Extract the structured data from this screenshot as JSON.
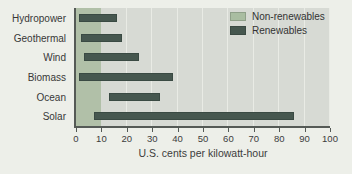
{
  "chart_data": {
    "type": "bar",
    "orientation": "horizontal-range",
    "xlabel": "U.S. cents per kilowatt-hour",
    "xlim": [
      0,
      100
    ],
    "xticks": [
      0,
      10,
      20,
      30,
      40,
      50,
      60,
      70,
      80,
      90,
      100
    ],
    "grid": true,
    "categories": [
      "Hydropower",
      "Geothermal",
      "Wind",
      "Biomass",
      "Ocean",
      "Solar"
    ],
    "series": [
      {
        "name": "Renewables",
        "color": "#46574f",
        "ranges": [
          [
            1,
            16
          ],
          [
            2,
            18
          ],
          [
            3,
            25
          ],
          [
            1,
            38
          ],
          [
            13,
            33
          ],
          [
            7,
            86
          ]
        ]
      }
    ],
    "reference_band": {
      "name": "Non-renewables",
      "color": "#b1c0a8",
      "range": [
        0,
        10
      ]
    },
    "legend": {
      "position": "top-right",
      "entries": [
        {
          "label": "Non-renewables",
          "color": "#a9bda1"
        },
        {
          "label": "Renewables",
          "color": "#46574f"
        }
      ]
    }
  }
}
